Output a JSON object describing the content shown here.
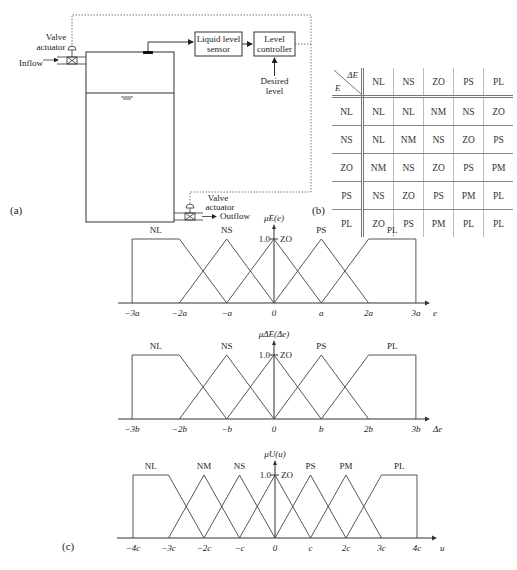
{
  "panels": {
    "a": "(a)",
    "b": "(b)",
    "c": "(c)"
  },
  "process_diagram": {
    "inflow_label": "Inflow",
    "outflow_label": "Outflow",
    "top_valve_actuator": [
      "Valve",
      "actuator"
    ],
    "bottom_valve_actuator": [
      "Valve",
      "actuator"
    ],
    "sensor_box": [
      "Liquid level",
      "sensor"
    ],
    "controller_box": [
      "Level",
      "controller"
    ],
    "setpoint": [
      "Desired",
      "level"
    ]
  },
  "rule_table": {
    "corner_top": "ΔE",
    "corner_bottom": "E",
    "columns": [
      "NL",
      "NS",
      "ZO",
      "PS",
      "PL"
    ],
    "rows": [
      {
        "label": "NL",
        "cells": [
          "NL",
          "NL",
          "NM",
          "NS",
          "ZO"
        ]
      },
      {
        "label": "NS",
        "cells": [
          "NL",
          "NM",
          "NS",
          "ZO",
          "PS"
        ]
      },
      {
        "label": "ZO",
        "cells": [
          "NM",
          "NS",
          "ZO",
          "PS",
          "PM"
        ]
      },
      {
        "label": "PS",
        "cells": [
          "NS",
          "ZO",
          "PS",
          "PM",
          "PL"
        ]
      },
      {
        "label": "PL",
        "cells": [
          "ZO",
          "PS",
          "PM",
          "PL",
          "PL"
        ]
      }
    ]
  },
  "chart_data": [
    {
      "type": "line",
      "title": "μE(e)",
      "ylabel": "μE(e)",
      "xlabel": "e",
      "peak_label": "1.0",
      "ticks": [
        "−3a",
        "−2a",
        "−a",
        "0",
        "a",
        "2a",
        "3a"
      ],
      "tick_values": [
        -3,
        -2,
        -1,
        0,
        1,
        2,
        3
      ],
      "ylim": [
        0,
        1
      ],
      "sets": [
        {
          "name": "NL",
          "points": [
            [
              -3,
              1
            ],
            [
              -2,
              1
            ],
            [
              -1,
              0
            ]
          ],
          "left_edge": true
        },
        {
          "name": "NS",
          "points": [
            [
              -2,
              0
            ],
            [
              -1,
              1
            ],
            [
              0,
              0
            ]
          ]
        },
        {
          "name": "ZO",
          "points": [
            [
              -1,
              0
            ],
            [
              0,
              1
            ],
            [
              1,
              0
            ]
          ]
        },
        {
          "name": "PS",
          "points": [
            [
              0,
              0
            ],
            [
              1,
              1
            ],
            [
              2,
              0
            ]
          ]
        },
        {
          "name": "PL",
          "points": [
            [
              1,
              0
            ],
            [
              2,
              1
            ],
            [
              3,
              1
            ]
          ],
          "right_edge": true
        }
      ]
    },
    {
      "type": "line",
      "title": "μΔE(Δe)",
      "ylabel": "μΔE(Δe)",
      "xlabel": "Δe",
      "peak_label": "1.0",
      "ticks": [
        "−3b",
        "−2b",
        "−b",
        "0",
        "b",
        "2b",
        "3b"
      ],
      "tick_values": [
        -3,
        -2,
        -1,
        0,
        1,
        2,
        3
      ],
      "ylim": [
        0,
        1
      ],
      "sets": [
        {
          "name": "NL",
          "points": [
            [
              -3,
              1
            ],
            [
              -2,
              1
            ],
            [
              -1,
              0
            ]
          ],
          "left_edge": true
        },
        {
          "name": "NS",
          "points": [
            [
              -2,
              0
            ],
            [
              -1,
              1
            ],
            [
              0,
              0
            ]
          ]
        },
        {
          "name": "ZO",
          "points": [
            [
              -1,
              0
            ],
            [
              0,
              1
            ],
            [
              1,
              0
            ]
          ]
        },
        {
          "name": "PS",
          "points": [
            [
              0,
              0
            ],
            [
              1,
              1
            ],
            [
              2,
              0
            ]
          ]
        },
        {
          "name": "PL",
          "points": [
            [
              1,
              0
            ],
            [
              2,
              1
            ],
            [
              3,
              1
            ]
          ],
          "right_edge": true
        }
      ]
    },
    {
      "type": "line",
      "title": "μU(u)",
      "ylabel": "μU(u)",
      "xlabel": "u",
      "peak_label": "1.0",
      "ticks": [
        "−4c",
        "−3c",
        "−2c",
        "−c",
        "0",
        "c",
        "2c",
        "3c",
        "4c"
      ],
      "tick_values": [
        -4,
        -3,
        -2,
        -1,
        0,
        1,
        2,
        3,
        4
      ],
      "ylim": [
        0,
        1
      ],
      "sets": [
        {
          "name": "NL",
          "points": [
            [
              -4,
              1
            ],
            [
              -3,
              1
            ],
            [
              -2,
              0
            ]
          ],
          "left_edge": true
        },
        {
          "name": "NM",
          "points": [
            [
              -3,
              0
            ],
            [
              -2,
              1
            ],
            [
              -1,
              0
            ]
          ]
        },
        {
          "name": "NS",
          "points": [
            [
              -2,
              0
            ],
            [
              -1,
              1
            ],
            [
              0,
              0
            ]
          ]
        },
        {
          "name": "ZO",
          "points": [
            [
              -1,
              0
            ],
            [
              0,
              1
            ],
            [
              1,
              0
            ]
          ]
        },
        {
          "name": "PS",
          "points": [
            [
              0,
              0
            ],
            [
              1,
              1
            ],
            [
              2,
              0
            ]
          ]
        },
        {
          "name": "PM",
          "points": [
            [
              1,
              0
            ],
            [
              2,
              1
            ],
            [
              3,
              0
            ]
          ]
        },
        {
          "name": "PL",
          "points": [
            [
              2,
              0
            ],
            [
              3,
              1
            ],
            [
              4,
              1
            ]
          ],
          "right_edge": true
        }
      ]
    }
  ]
}
